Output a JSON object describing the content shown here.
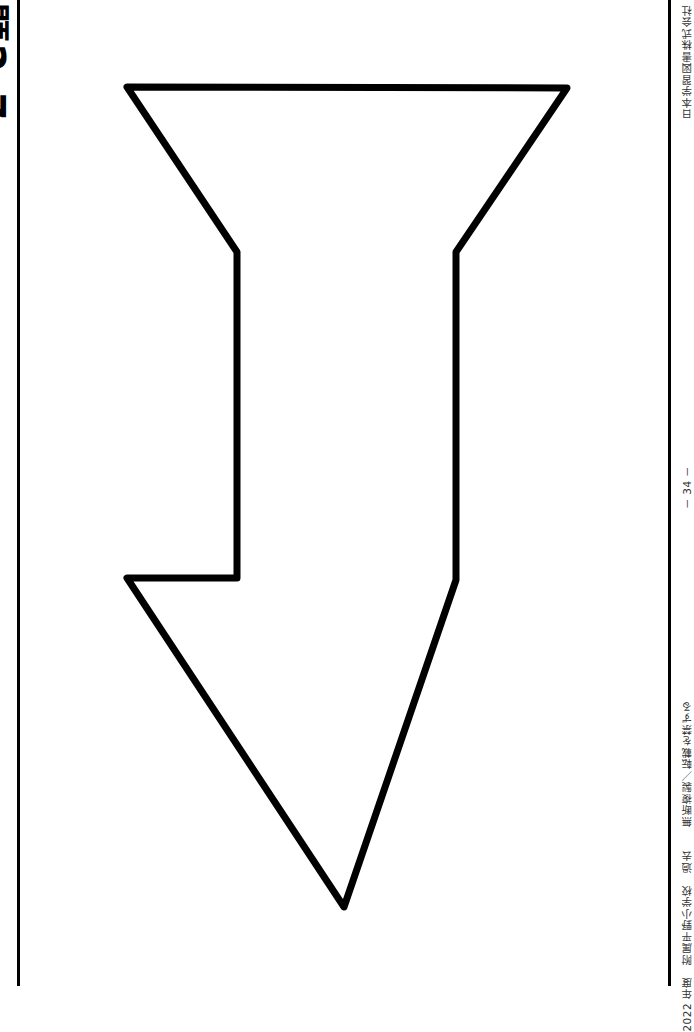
{
  "page": {
    "title": "問題2-7",
    "publisher": "日本学習図書株式会社",
    "page_number": "－ 34 －",
    "footer_left": "2022 年度　附属平野小学校　過去　　無断複製／転載を禁ずる"
  },
  "figure": {
    "shape": "down-arrow-outline",
    "stroke_color": "#000000",
    "fill_color": "#ffffff"
  }
}
